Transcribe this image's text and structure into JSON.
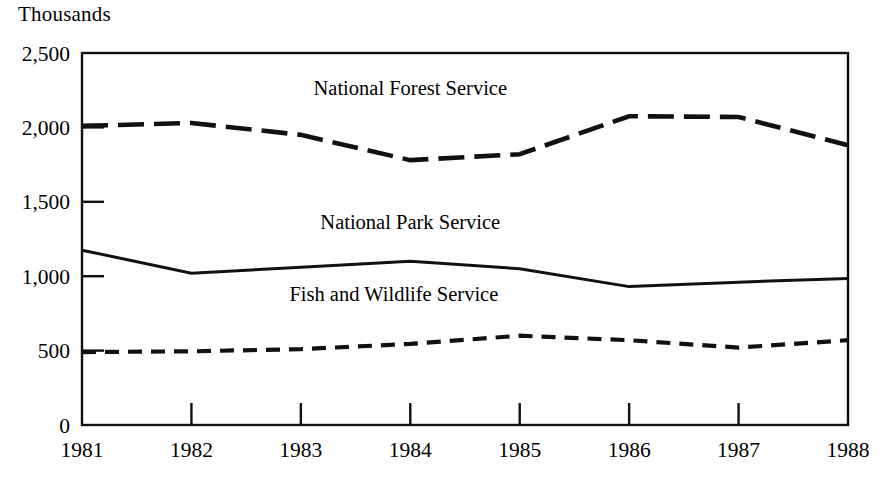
{
  "chart_data": {
    "type": "line",
    "title": "",
    "ylabel": "Thousands",
    "xlabel": "",
    "categories": [
      "1981",
      "1982",
      "1983",
      "1984",
      "1985",
      "1986",
      "1987",
      "1988"
    ],
    "x": [
      1981,
      1982,
      1983,
      1984,
      1985,
      1986,
      1987,
      1988
    ],
    "ylim": [
      0,
      2500
    ],
    "xlim": [
      1981,
      1988
    ],
    "yticks": [
      0,
      500,
      1000,
      1500,
      2000,
      2500
    ],
    "ytick_labels": [
      "0",
      "500",
      "1,000",
      "1,500",
      "2,000",
      "2,500"
    ],
    "grid": false,
    "legend_position": "inline-annotations",
    "series": [
      {
        "name": "National Forest Service",
        "style": "long-dashed",
        "values": [
          2010,
          2030,
          1950,
          1780,
          1820,
          2075,
          2070,
          1880
        ]
      },
      {
        "name": "National Park Service",
        "style": "solid",
        "values": [
          1175,
          1020,
          1060,
          1100,
          1050,
          930,
          960,
          985
        ]
      },
      {
        "name": "Fish and Wildlife Service",
        "style": "short-dashed",
        "values": [
          490,
          495,
          510,
          545,
          600,
          570,
          520,
          570
        ]
      }
    ],
    "annotations": [
      {
        "text": "National Forest Service",
        "x": 1984.0,
        "y": 2220
      },
      {
        "text": "National Park Service",
        "x": 1984.0,
        "y": 1320
      },
      {
        "text": "Fish and Wildlife Service",
        "x": 1983.85,
        "y": 830
      }
    ],
    "colors": {
      "ink": "#111111",
      "background": "#ffffff"
    }
  }
}
